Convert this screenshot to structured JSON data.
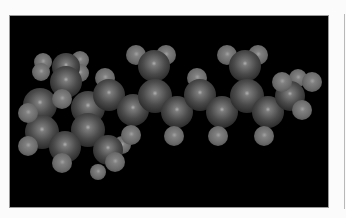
{
  "figure": {
    "background_color": "#000000",
    "frame_color": "#fbfbfb",
    "atom_color": "#7a7a7a"
  },
  "atoms": [
    {
      "el": "h",
      "x": 43,
      "y": 62,
      "r": 9
    },
    {
      "el": "h",
      "x": 80,
      "y": 60,
      "r": 9
    },
    {
      "el": "h",
      "x": 41,
      "y": 72,
      "r": 9
    },
    {
      "el": "h",
      "x": 80,
      "y": 73,
      "r": 9
    },
    {
      "el": "c",
      "x": 66,
      "y": 67,
      "r": 14
    },
    {
      "el": "c",
      "x": 66,
      "y": 82,
      "r": 16
    },
    {
      "el": "c",
      "x": 40,
      "y": 105,
      "r": 17
    },
    {
      "el": "c",
      "x": 88,
      "y": 108,
      "r": 17
    },
    {
      "el": "c",
      "x": 42,
      "y": 132,
      "r": 17
    },
    {
      "el": "c",
      "x": 88,
      "y": 130,
      "r": 17
    },
    {
      "el": "c",
      "x": 65,
      "y": 147,
      "r": 16
    },
    {
      "el": "h",
      "x": 62,
      "y": 99,
      "r": 10
    },
    {
      "el": "h",
      "x": 28,
      "y": 113,
      "r": 10
    },
    {
      "el": "h",
      "x": 28,
      "y": 146,
      "r": 10
    },
    {
      "el": "h",
      "x": 62,
      "y": 163,
      "r": 10
    },
    {
      "el": "h",
      "x": 98,
      "y": 172,
      "r": 8
    },
    {
      "el": "h",
      "x": 122,
      "y": 145,
      "r": 9
    },
    {
      "el": "c",
      "x": 108,
      "y": 150,
      "r": 15
    },
    {
      "el": "h",
      "x": 115,
      "y": 162,
      "r": 10
    },
    {
      "el": "h",
      "x": 105,
      "y": 78,
      "r": 10
    },
    {
      "el": "c",
      "x": 109,
      "y": 95,
      "r": 16
    },
    {
      "el": "c",
      "x": 133,
      "y": 110,
      "r": 16
    },
    {
      "el": "h",
      "x": 131,
      "y": 135,
      "r": 10
    },
    {
      "el": "h",
      "x": 136,
      "y": 55,
      "r": 10
    },
    {
      "el": "h",
      "x": 166,
      "y": 55,
      "r": 10
    },
    {
      "el": "c",
      "x": 154,
      "y": 66,
      "r": 16
    },
    {
      "el": "c",
      "x": 155,
      "y": 96,
      "r": 17
    },
    {
      "el": "c",
      "x": 177,
      "y": 112,
      "r": 16
    },
    {
      "el": "h",
      "x": 174,
      "y": 136,
      "r": 10
    },
    {
      "el": "h",
      "x": 197,
      "y": 78,
      "r": 10
    },
    {
      "el": "c",
      "x": 200,
      "y": 95,
      "r": 16
    },
    {
      "el": "c",
      "x": 222,
      "y": 112,
      "r": 16
    },
    {
      "el": "h",
      "x": 218,
      "y": 136,
      "r": 10
    },
    {
      "el": "h",
      "x": 227,
      "y": 55,
      "r": 10
    },
    {
      "el": "h",
      "x": 258,
      "y": 55,
      "r": 10
    },
    {
      "el": "c",
      "x": 245,
      "y": 66,
      "r": 16
    },
    {
      "el": "c",
      "x": 247,
      "y": 96,
      "r": 17
    },
    {
      "el": "c",
      "x": 268,
      "y": 112,
      "r": 16
    },
    {
      "el": "h",
      "x": 264,
      "y": 136,
      "r": 10
    },
    {
      "el": "h",
      "x": 298,
      "y": 78,
      "r": 9
    },
    {
      "el": "c",
      "x": 290,
      "y": 96,
      "r": 15
    },
    {
      "el": "h",
      "x": 282,
      "y": 82,
      "r": 10
    },
    {
      "el": "h",
      "x": 312,
      "y": 82,
      "r": 10
    },
    {
      "el": "h",
      "x": 302,
      "y": 110,
      "r": 10
    }
  ]
}
